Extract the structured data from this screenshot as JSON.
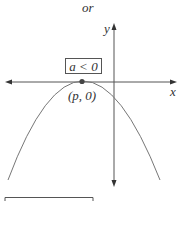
{
  "heading": "or",
  "graph": {
    "x_axis_label": "x",
    "y_axis_label": "y",
    "condition_label": "a < 0",
    "vertex_label": "(p, 0)",
    "vertex": {
      "x": "p",
      "y": "0"
    },
    "curve": "downward-opening parabola tangent to x-axis at vertex",
    "line_color": "#666666"
  }
}
